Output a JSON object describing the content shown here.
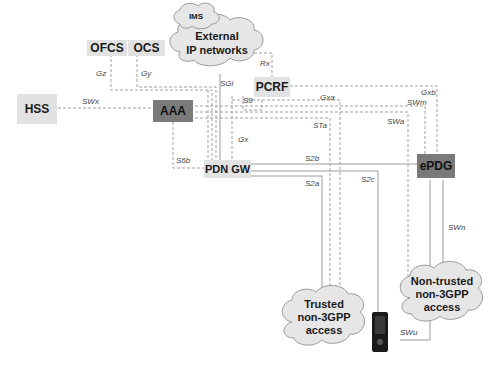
{
  "diagram": {
    "nodes": {
      "hss": "HSS",
      "ofcs": "OFCS",
      "ocs": "OCS",
      "aaa": "AAA",
      "pcrf": "PCRF",
      "pdn_gw": "PDN GW",
      "epdg": "ePDG"
    },
    "clouds": {
      "ims": "IMS",
      "external_line1": "External",
      "external_line2": "IP networks",
      "trusted_line1": "Trusted",
      "trusted_line2": "non-3GPP",
      "trusted_line3": "access",
      "untrusted_line1": "Non-trusted",
      "untrusted_line2": "non-3GPP",
      "untrusted_line3": "access"
    },
    "interfaces": {
      "gz": "Gz",
      "gy": "Gy",
      "swx": "SWx",
      "rx": "Rx",
      "sgi": "SGi",
      "s9": "S9",
      "gxa": "Gxa",
      "gxb": "Gxb",
      "swm": "SWm",
      "swa": "SWa",
      "sta": "STa",
      "gx": "Gx",
      "s6b": "S6b",
      "s2b": "S2b",
      "s2a": "S2a",
      "s2c": "S2c",
      "swn": "SWn",
      "swu": "SWu"
    },
    "colors": {
      "light_node": "#e2e2e2",
      "dark_node": "#7a7a7a",
      "cloud_fill": "#e6e6e6",
      "line": "#9a9a9a"
    }
  }
}
